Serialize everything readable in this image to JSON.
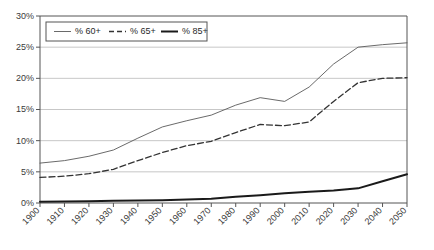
{
  "chart_data": {
    "type": "line",
    "title": "",
    "xlabel": "",
    "ylabel": "",
    "grid": true,
    "legend_position": "top-left-inside",
    "xlim": [
      1900,
      2050
    ],
    "ylim": [
      0,
      30
    ],
    "ytick_labels": [
      "0%",
      "5%",
      "10%",
      "15%",
      "20%",
      "25%",
      "30%"
    ],
    "ytick_values": [
      0,
      5,
      10,
      15,
      20,
      25,
      30
    ],
    "categories": [
      1900,
      1910,
      1920,
      1930,
      1940,
      1950,
      1960,
      1970,
      1980,
      1990,
      2000,
      2010,
      2020,
      2030,
      2040,
      2050
    ],
    "xtick_labels": [
      "1900",
      "1910",
      "1920",
      "1930",
      "1940",
      "1950",
      "1960",
      "1970",
      "1980",
      "1990",
      "2000",
      "2010",
      "2020",
      "2030",
      "2040",
      "2050"
    ],
    "series": [
      {
        "name": "% 60+",
        "style": "solid",
        "color": "#595959",
        "width": 0.9,
        "values": [
          6.4,
          6.8,
          7.5,
          8.5,
          10.4,
          12.2,
          13.2,
          14.1,
          15.7,
          16.9,
          16.3,
          18.6,
          22.3,
          25.0,
          25.4,
          25.7
        ]
      },
      {
        "name": "% 65+",
        "style": "dashed",
        "color": "#333333",
        "width": 1.3,
        "values": [
          4.1,
          4.3,
          4.7,
          5.4,
          6.8,
          8.1,
          9.2,
          9.9,
          11.3,
          12.6,
          12.4,
          13.0,
          16.3,
          19.3,
          20.0,
          20.1
        ]
      },
      {
        "name": "% 85+",
        "style": "solid",
        "color": "#1a1a1a",
        "width": 2.0,
        "values": [
          0.2,
          0.25,
          0.3,
          0.35,
          0.4,
          0.45,
          0.55,
          0.7,
          1.0,
          1.25,
          1.55,
          1.8,
          2.0,
          2.35,
          3.5,
          4.6
        ]
      }
    ]
  },
  "legend": {
    "items": [
      {
        "label": "% 60+",
        "key": "solid-thin"
      },
      {
        "label": "% 65+",
        "key": "dashed"
      },
      {
        "label": "% 85+",
        "key": "solid-thick"
      }
    ]
  }
}
